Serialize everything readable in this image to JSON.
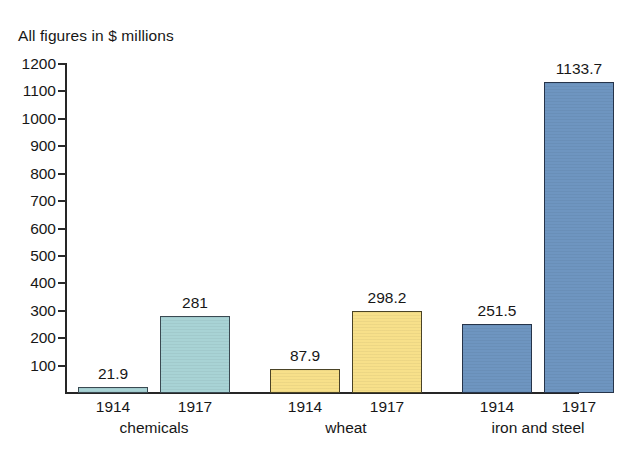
{
  "chart_data": {
    "type": "bar",
    "title": "All figures in $ millions",
    "xlabel": "",
    "ylabel": "",
    "ylim": [
      0,
      1200
    ],
    "grid": false,
    "legend": "none",
    "y_ticks": [
      1200,
      1100,
      1000,
      900,
      800,
      700,
      600,
      500,
      400,
      300,
      200,
      100
    ],
    "y_tick_labels": [
      "1200",
      "1100",
      "1000",
      "900",
      "800",
      "700",
      "600",
      "500",
      "400",
      "300",
      "200",
      "100"
    ],
    "categories": [
      "chemicals",
      "wheat",
      "iron and steel"
    ],
    "series": [
      {
        "name": "1914",
        "values": [
          21.9,
          87.9,
          251.5
        ]
      },
      {
        "name": "1917",
        "values": [
          281,
          298.2,
          1133.7
        ]
      }
    ],
    "bars": [
      {
        "group": "chemicals",
        "year": "1914",
        "value": 21.9,
        "label": "21.9",
        "color": "#a8d3d5"
      },
      {
        "group": "chemicals",
        "year": "1917",
        "value": 281,
        "label": "281",
        "color": "#a8d3d5"
      },
      {
        "group": "wheat",
        "year": "1914",
        "value": 87.9,
        "label": "87.9",
        "color": "#f7e08a"
      },
      {
        "group": "wheat",
        "year": "1917",
        "value": 298.2,
        "label": "298.2",
        "color": "#f7e08a"
      },
      {
        "group": "iron and steel",
        "year": "1914",
        "value": 251.5,
        "label": "251.5",
        "color": "#6e95c0"
      },
      {
        "group": "iron and steel",
        "year": "1917",
        "value": 1133.7,
        "label": "1133.7",
        "color": "#6e95c0"
      }
    ],
    "group_labels": [
      "chemicals",
      "wheat",
      "iron and steel"
    ],
    "colors": {
      "chemicals": "#a8d3d5",
      "wheat": "#f7e08a",
      "iron_and_steel": "#6e95c0",
      "axis": "#262626",
      "text": "#171717",
      "background": "#ffffff"
    }
  }
}
